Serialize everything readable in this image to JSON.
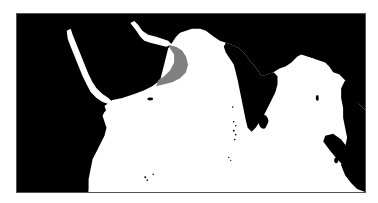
{
  "map": {
    "region": "Arabian Sea / Indian Ocean",
    "colors": {
      "land": "#000000",
      "water": "#ffffff",
      "highlight": "#808080",
      "frame": "#555555"
    },
    "highlighted_area": "gray band along Gulf of Oman / northern Arabian Sea coast"
  }
}
